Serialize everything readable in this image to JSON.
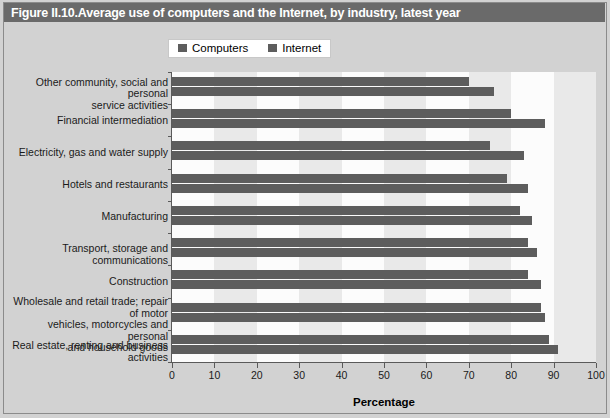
{
  "figure": {
    "title": "Figure II.10.Average use of computers and the Internet, by industry, latest year",
    "title_bar_color": "#6a6a6a",
    "background_color": "#d2d2d2",
    "plot_background_color": "#e9e9e9",
    "band_color": "#fcfcfc",
    "bar_color": "#5d5d5d"
  },
  "legend": {
    "position": "top-center",
    "items": [
      {
        "label": "Computers",
        "color": "#5d5d5d"
      },
      {
        "label": "Internet",
        "color": "#5d5d5d"
      }
    ]
  },
  "chart_data": {
    "type": "bar",
    "orientation": "horizontal",
    "title": "Figure II.10.Average use of computers and the Internet, by industry, latest year",
    "xlabel": "Percentage",
    "ylabel": "",
    "xlim": [
      0,
      100
    ],
    "xticks": [
      0,
      10,
      20,
      30,
      40,
      50,
      60,
      70,
      80,
      90,
      100
    ],
    "grid": false,
    "legend": [
      "Computers",
      "Internet"
    ],
    "categories": [
      "Other community, social and personal service activities",
      "Financial intermediation",
      "Electricity, gas and water supply",
      "Hotels and restaurants",
      "Manufacturing",
      "Transport, storage and communications",
      "Construction",
      "Wholesale and retail trade; repair of motor vehicles, motorcycles and personal and household goods",
      "Real estate, renting and business activities"
    ],
    "category_lines": [
      [
        "Other community, social and personal",
        "service activities"
      ],
      [
        "Financial intermediation"
      ],
      [
        "Electricity, gas and water supply"
      ],
      [
        "Hotels and restaurants"
      ],
      [
        "Manufacturing"
      ],
      [
        "Transport, storage and communications"
      ],
      [
        "Construction"
      ],
      [
        "Wholesale and retail trade; repair of motor",
        "vehicles, motorcycles and personal",
        "and household goods"
      ],
      [
        "Real estate, renting and business activities"
      ]
    ],
    "series": [
      {
        "name": "Computers",
        "color": "#5d5d5d",
        "values": [
          70,
          80,
          75,
          79,
          82,
          84,
          84,
          87,
          89
        ]
      },
      {
        "name": "Internet",
        "color": "#5d5d5d",
        "values": [
          76,
          88,
          83,
          84,
          85,
          86,
          87,
          88,
          91
        ]
      }
    ]
  }
}
